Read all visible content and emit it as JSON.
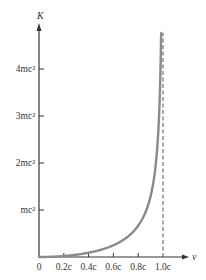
{
  "chart_data": {
    "type": "line",
    "title": "",
    "xlabel": "v",
    "ylabel": "K",
    "x_ticks": [
      "0",
      "0.2c",
      "0.4c",
      "0.6c",
      "0.8c",
      "1.0c"
    ],
    "x_tick_values": [
      0,
      0.2,
      0.4,
      0.6,
      0.8,
      1.0
    ],
    "y_ticks": [
      "mc²",
      "2mc²",
      "3mc²",
      "4mc²"
    ],
    "y_tick_values": [
      1,
      2,
      3,
      4
    ],
    "xlim": [
      0,
      1.0
    ],
    "ylim": [
      0,
      4.8
    ],
    "grid": false,
    "legend": null,
    "series": [
      {
        "name": "K = (γ − 1)mc²",
        "x": [
          0,
          0.1,
          0.2,
          0.3,
          0.4,
          0.5,
          0.6,
          0.7,
          0.8,
          0.85,
          0.9,
          0.93,
          0.95,
          0.97,
          0.98,
          0.985,
          0.988
        ],
        "y": [
          0,
          0.005,
          0.021,
          0.048,
          0.091,
          0.155,
          0.25,
          0.4,
          0.667,
          0.898,
          1.294,
          1.721,
          2.203,
          3.113,
          4.025,
          4.79,
          4.8
        ],
        "color": "#8a8a8a"
      }
    ],
    "annotations": [
      {
        "type": "vertical-dashed-line",
        "x": 1.0,
        "label": "asymptote at v = c"
      }
    ]
  },
  "colors": {
    "axis": "#333333",
    "curve": "#8a8a8a",
    "asymptote": "#555555"
  }
}
